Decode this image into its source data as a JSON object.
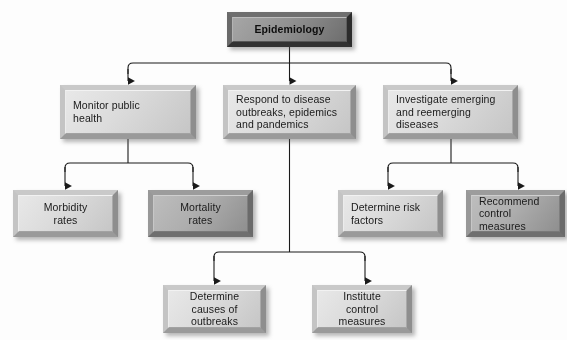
{
  "diagram": {
    "title": "Epidemiology",
    "type": "organizational-flowchart",
    "root": {
      "id": "epidemiology",
      "label": "Epidemiology",
      "shade": "dark"
    },
    "level2": [
      {
        "id": "monitor-public-health",
        "label": "Monitor public\nhealth",
        "shade": "light"
      },
      {
        "id": "respond-to-disease-outbreaks",
        "label": "Respond to disease\noutbreaks, epidemics\nand pandemics",
        "shade": "light"
      },
      {
        "id": "investigate-emerging-diseases",
        "label": "Investigate emerging\nand reemerging\ndiseases",
        "shade": "light"
      }
    ],
    "level3": [
      {
        "id": "morbidity-rates",
        "label": "Morbidity\nrates",
        "shade": "light",
        "parent": "monitor-public-health"
      },
      {
        "id": "mortality-rates",
        "label": "Mortality\nrates",
        "shade": "medium",
        "parent": "monitor-public-health"
      },
      {
        "id": "determine-risk-factors",
        "label": "Determine risk\nfactors",
        "shade": "light",
        "parent": "investigate-emerging-diseases"
      },
      {
        "id": "recommend-control-measures",
        "label": "Recommend\ncontrol\nmeasures",
        "shade": "medium",
        "parent": "investigate-emerging-diseases"
      }
    ],
    "level4": [
      {
        "id": "determine-causes-of-outbreaks",
        "label": "Determine\ncauses of\noutbreaks",
        "shade": "light",
        "parent": "respond-to-disease-outbreaks"
      },
      {
        "id": "institute-control-measures",
        "label": "Institute\ncontrol\nmeasures",
        "shade": "light",
        "parent": "respond-to-disease-outbreaks"
      }
    ],
    "colors": {
      "background": "#fdfdfd",
      "connector": "#1a1a1a",
      "text": "#1a1a1a",
      "box_light": "#dcdcdc",
      "box_medium": "#aeaeae",
      "box_dark": "#919191"
    }
  }
}
